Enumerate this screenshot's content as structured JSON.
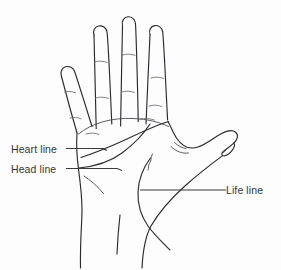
{
  "figure": {
    "background_color": "#fdfdfd",
    "ink_color": "#2b2b2e"
  },
  "labels": {
    "heart_line": "Heart line",
    "head_line": "Head line",
    "life_line": "Life line"
  },
  "anatomy": {
    "fingers": [
      "index-finger",
      "middle-finger",
      "ring-finger",
      "little-finger"
    ],
    "thumb": "thumb",
    "palm": "palm",
    "wrist": "wrist"
  }
}
